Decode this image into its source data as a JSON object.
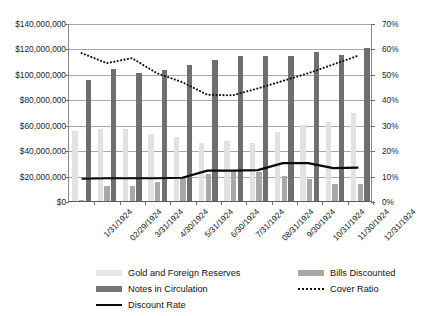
{
  "chart_data": {
    "type": "bar",
    "title": "",
    "subtitle": "",
    "xlabel": "",
    "ylabel": "",
    "y2label": "",
    "grid": true,
    "legend_position": "bottom",
    "categories": [
      "1/31/1924",
      "02/29/1924",
      "3/31/1924",
      "4/30/1924",
      "5/31/1924",
      "6/30/1924",
      "7/31/1924",
      "08/31/1924",
      "9/30/1924",
      "10/31/1924",
      "11/30/1924",
      "12/31/1924"
    ],
    "ylim": [
      0,
      140000000
    ],
    "yticks": [
      0,
      20000000,
      40000000,
      60000000,
      80000000,
      100000000,
      120000000,
      140000000
    ],
    "ytick_labels": [
      "$0",
      "$20,000,000",
      "$40,000,000",
      "$60,000,000",
      "$80,000,000",
      "$100,000,000",
      "$120,000,000",
      "$140,000,000"
    ],
    "y2lim": [
      0,
      70
    ],
    "y2ticks": [
      0,
      10,
      20,
      30,
      40,
      50,
      60,
      70
    ],
    "y2tick_labels": [
      "0%",
      "10%",
      "20%",
      "30%",
      "40%",
      "50%",
      "60%",
      "70%"
    ],
    "series": [
      {
        "name": "Gold and Foreign Reserves",
        "type": "bar",
        "axis": "left",
        "color": "#e2e2e2",
        "values": [
          55000000,
          56500000,
          56500000,
          53000000,
          50000000,
          45500000,
          47500000,
          45500000,
          54500000,
          60000000,
          62500000,
          69500000
        ]
      },
      {
        "name": "Bills Discounted",
        "type": "bar",
        "axis": "left",
        "color": "#a8a8a8",
        "values": [
          1000000,
          12000000,
          12000000,
          15000000,
          18500000,
          21500000,
          23500000,
          22500000,
          20000000,
          17000000,
          13500000,
          13500000
        ]
      },
      {
        "name": "Notes in Circulation",
        "type": "bar",
        "axis": "left",
        "color": "#6f6f6f",
        "values": [
          95000000,
          104000000,
          101000000,
          103000000,
          107000000,
          111000000,
          114000000,
          114000000,
          114000000,
          117000000,
          115000000,
          120000000
        ]
      },
      {
        "name": "Cover Ratio",
        "type": "line",
        "style": "dotted",
        "axis": "right",
        "color": "#111111",
        "values": [
          58.5,
          54.5,
          56.5,
          50.5,
          47.0,
          42.0,
          41.8,
          44.5,
          47.5,
          50.5,
          54.0,
          57.5
        ]
      },
      {
        "name": "Discount Rate",
        "type": "line",
        "style": "solid",
        "axis": "right",
        "color": "#0a0a0a",
        "values": [
          8.8,
          9.0,
          9.0,
          9.0,
          9.2,
          12.0,
          12.0,
          12.2,
          15.0,
          15.0,
          13.0,
          13.2
        ]
      }
    ]
  },
  "legend": {
    "items": [
      {
        "label": "Gold and Foreign Reserves",
        "marker": "swatch-gold"
      },
      {
        "label": "Bills Discounted",
        "marker": "swatch-bills"
      },
      {
        "label": "Notes in Circulation",
        "marker": "swatch-notes"
      },
      {
        "label": "Cover Ratio",
        "marker": "dotted-line"
      },
      {
        "label": "Discount Rate",
        "marker": "solid-line"
      }
    ]
  }
}
